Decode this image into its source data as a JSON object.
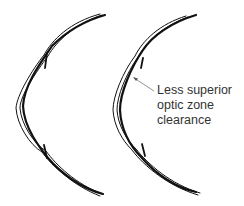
{
  "figure": {
    "panels": [
      {
        "id": "left",
        "description": "Cornea profile with contact lens (reference fit)"
      },
      {
        "id": "right",
        "description": "Cornea profile with contact lens (reduced superior clearance)"
      }
    ],
    "annotation": {
      "lines": [
        "Less superior",
        "optic zone",
        "clearance"
      ],
      "target_panel": "right"
    },
    "colors": {
      "stroke": "#111111",
      "text": "#333333",
      "arrow": "#888888",
      "background": "#ffffff"
    }
  }
}
